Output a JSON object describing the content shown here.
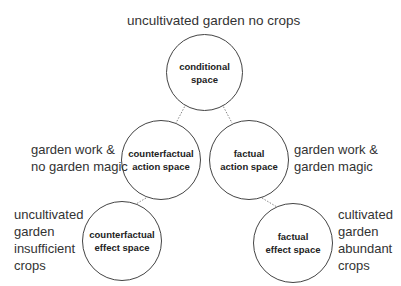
{
  "diagram": {
    "top_label": "uncultivated garden no crops",
    "nodes": {
      "conditional": {
        "lines": [
          "conditional",
          "space"
        ]
      },
      "cf_action": {
        "lines": [
          "counterfactual",
          "action space"
        ]
      },
      "f_action": {
        "lines": [
          "factual",
          "action space"
        ]
      },
      "cf_effect": {
        "lines": [
          "counterfactual",
          "effect space"
        ]
      },
      "f_effect": {
        "lines": [
          "factual",
          "effect space"
        ]
      }
    },
    "side_labels": {
      "cf_action": [
        "garden work &",
        "no garden magic"
      ],
      "f_action": [
        "garden work &",
        "garden magic"
      ],
      "cf_effect": [
        "uncultivated",
        "garden",
        "insufficient",
        "crops"
      ],
      "f_effect": [
        "cultivated",
        "garden",
        "abundant",
        "crops"
      ]
    },
    "edges": [
      {
        "from": "conditional",
        "to": "cf_action",
        "style": "dotted"
      },
      {
        "from": "conditional",
        "to": "f_action",
        "style": "dotted"
      },
      {
        "from": "cf_action",
        "to": "cf_effect",
        "style": "dotted"
      },
      {
        "from": "f_action",
        "to": "f_effect",
        "style": "dotted"
      }
    ]
  }
}
